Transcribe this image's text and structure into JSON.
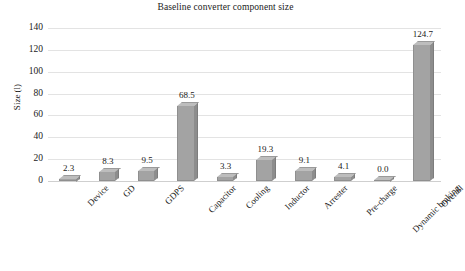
{
  "chart_data": {
    "type": "bar",
    "title": "Baseline converter component size",
    "xlabel": "",
    "ylabel": "Size (l)",
    "categories": [
      "Device",
      "GD",
      "GDPS",
      "Capacitor",
      "Cooling",
      "Inductor",
      "Arrester",
      "Pre-charge",
      "Dynamic braking",
      "Overall"
    ],
    "values": [
      2.3,
      8.3,
      9.5,
      68.5,
      3.3,
      19.3,
      9.1,
      4.1,
      0.0,
      124.7
    ],
    "value_labels": [
      "2.3",
      "8.3",
      "9.5",
      "68.5",
      "3.3",
      "19.3",
      "9.1",
      "4.1",
      "0.0",
      "124.7"
    ],
    "ylim": [
      0,
      140
    ],
    "yticks": [
      0,
      20,
      40,
      60,
      80,
      100,
      120,
      140
    ],
    "ytick_labels": [
      "0",
      "20",
      "40",
      "60",
      "80",
      "100",
      "120",
      "140"
    ],
    "grid": true,
    "legend": false,
    "bar_color": "#a3a3a3",
    "bar_top_color": "#bdbdbd",
    "bar_side_color": "#8d8d8d",
    "gridline_color": "#e3e3e3",
    "text_color": "#1a1a1a",
    "background": "#ffffff",
    "style": "3d-bar"
  }
}
